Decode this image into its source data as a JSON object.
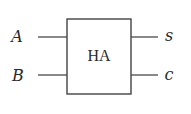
{
  "diagram": {
    "type": "half-adder-block",
    "block": {
      "label": "HA"
    },
    "inputs": [
      {
        "label": "A"
      },
      {
        "label": "B"
      }
    ],
    "outputs": [
      {
        "label": "s"
      },
      {
        "label": "c"
      }
    ],
    "colors": {
      "line": "#444444",
      "text": "#2a2a2a",
      "background": "#ffffff"
    }
  }
}
